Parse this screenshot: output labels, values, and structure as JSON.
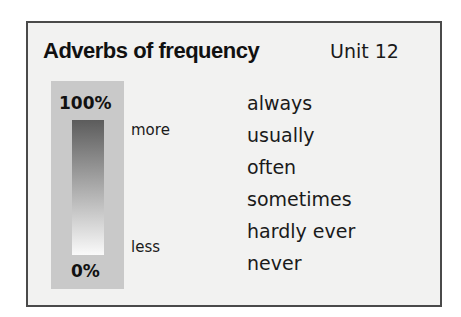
{
  "header": {
    "title": "Adverbs of frequency",
    "unit": "Unit 12"
  },
  "scale": {
    "top_label": "100%",
    "bottom_label": "0%",
    "more_label": "more",
    "less_label": "less",
    "gradient_top_color": "#5c5c5c",
    "gradient_bottom_color": "#fafafa"
  },
  "adverbs": [
    "always",
    "usually",
    "often",
    "sometimes",
    "hardly ever",
    "never"
  ]
}
